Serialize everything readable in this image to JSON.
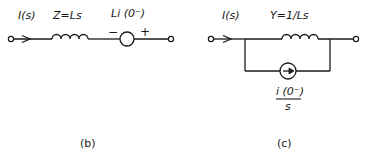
{
  "figure_b": {
    "caption": "(b)",
    "current_label": "I(s)",
    "impedance_label": "Z=Ls",
    "source_label": "Li (0⁻)",
    "source_minus": "−",
    "source_plus": "+",
    "components": [
      "input-terminal",
      "current-direction-arrow",
      "inductor",
      "voltage-source",
      "output-terminal"
    ],
    "topology": "series"
  },
  "figure_c": {
    "caption": "(c)",
    "current_label": "I(s)",
    "admittance_label": "Y=1/Ls",
    "source_label_numerator": "i (0⁻)",
    "source_label_denominator": "s",
    "components": [
      "input-terminal",
      "current-direction-arrow",
      "inductor",
      "current-source",
      "output-terminal"
    ],
    "topology": "parallel"
  },
  "colors": {
    "ink": "#1a1a1a",
    "background": "#ffffff"
  }
}
